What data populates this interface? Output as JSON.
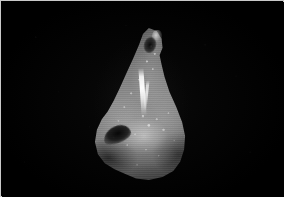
{
  "image": {
    "kind": "photograph",
    "subject": "specimen",
    "subject_description": "teardrop-shaped grayscale specimen, narrow hooked apex at top widening to a broad rounded base",
    "colors": {
      "background": "#000000",
      "frame_border": "#c9c9c9",
      "specimen_midtone": "#8a8a8a",
      "specimen_shadow": "#3a3a3a",
      "specimen_highlight": "#ffffff"
    },
    "regions": {
      "apex": "hooked pointed tip with dark void beneath",
      "midbody": "bright near-white vertical streak",
      "lower_left": "dark curved crevice notch",
      "base": "broad rounded rim in shadow"
    }
  }
}
